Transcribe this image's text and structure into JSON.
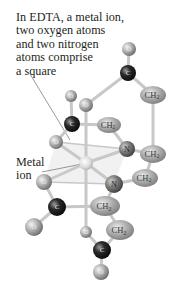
{
  "figure": {
    "caption_lines": [
      "In EDTA, a metal ion,",
      "two oxygen atoms",
      "and two nitrogen",
      "atoms comprise",
      "a square"
    ],
    "metal_label_lines": [
      "Metal",
      "ion"
    ],
    "atoms": {
      "oxygen_symbol": "O",
      "carbon_symbol": "C",
      "nitrogen_symbol": "N",
      "ch2_symbol": "CH",
      "ch2_subscript": "2"
    },
    "colors": {
      "oxygen": "#a9a9a9",
      "carbon": "#1e1e1e",
      "ch2": "#a6a6a6",
      "nitrogen": "#7a7a7a",
      "metal": "#dcdcdc",
      "bond": "#c4c4c4",
      "square_plane": "#ececec",
      "text": "#231f20"
    }
  }
}
